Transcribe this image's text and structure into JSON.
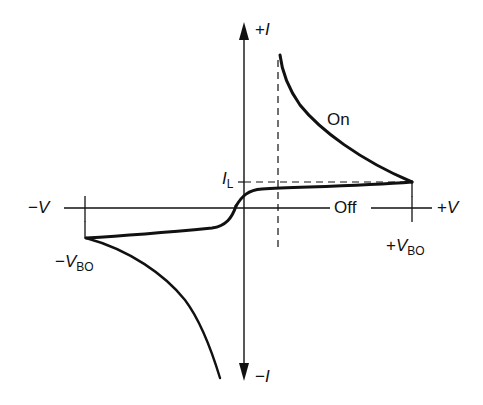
{
  "diagram": {
    "type": "diac-iv-characteristic",
    "axes": {
      "y_positive_label_sign": "+",
      "y_positive_label_var": "I",
      "y_negative_label_sign": "−",
      "y_negative_label_var": "I",
      "x_positive_label_sign": "+",
      "x_positive_label_var": "V",
      "x_negative_label_sign": "−",
      "x_negative_label_var": "V"
    },
    "labels": {
      "on": "On",
      "off": "Off",
      "latching_current_var": "I",
      "latching_current_sub": "L",
      "pos_breakover_sign": "+",
      "pos_breakover_var": "V",
      "pos_breakover_sub": "BO",
      "neg_breakover_sign": "−",
      "neg_breakover_var": "V",
      "neg_breakover_sub": "BO"
    },
    "colors": {
      "ink": "#111111",
      "background": "#ffffff"
    }
  }
}
